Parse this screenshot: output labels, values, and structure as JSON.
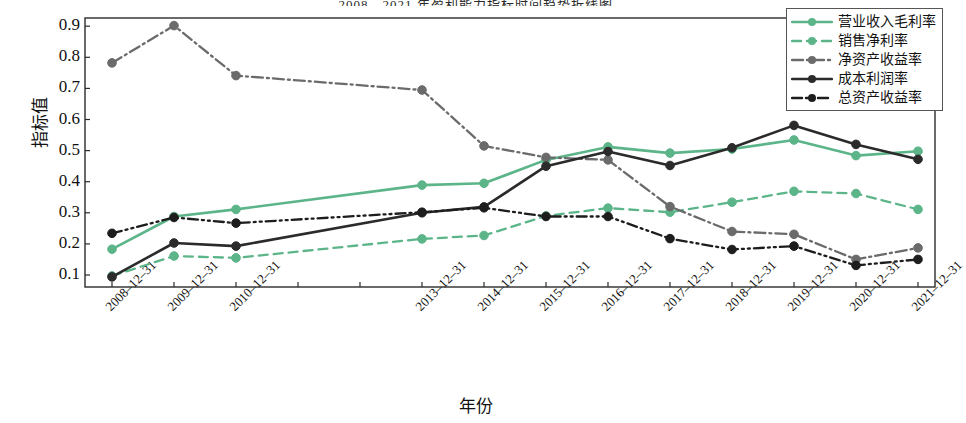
{
  "chart_data": {
    "type": "line",
    "title": "2008—2021 年盈利能力指标时间趋势折线图",
    "xlabel": "年份",
    "ylabel": "指标值",
    "ylim": [
      0.06,
      0.95
    ],
    "yticks": [
      0.1,
      0.2,
      0.3,
      0.4,
      0.5,
      0.6,
      0.7,
      0.8,
      0.9
    ],
    "ytick_labels": [
      "0.1",
      "0.2",
      "0.3",
      "0.4",
      "0.5",
      "0.6",
      "0.7",
      "0.8",
      "0.9"
    ],
    "grid": false,
    "legend_position": "top-right",
    "categories": [
      "2008-12-31",
      "2009-12-31",
      "2010-12-31",
      "2011-12-31",
      "2012-12-31",
      "2013-12-31",
      "2014-12-31",
      "2015-12-31",
      "2016-12-31",
      "2017-12-31",
      "2018-12-31",
      "2019-12-31",
      "2020-12-31",
      "2021-12-31"
    ],
    "tick_labels": [
      "2008–12–31",
      "2009–12–31",
      "2010–12–31",
      "",
      "",
      "2013–12–31",
      "2014–12–31",
      "2015–12–31",
      "2016–12–31",
      "2017–12–31",
      "2018–12–31",
      "2019–12–31",
      "2020–12–31",
      "2021–12–31"
    ],
    "series": [
      {
        "name": "营业收入毛利率",
        "color": "#5cb589",
        "style": "solid",
        "values": [
          0.183,
          0.288,
          0.311,
          null,
          null,
          0.389,
          0.395,
          0.47,
          0.512,
          0.492,
          0.505,
          0.534,
          0.484,
          0.498
        ]
      },
      {
        "name": "销售净利率",
        "color": "#5cb589",
        "style": "dashed",
        "values": [
          0.097,
          0.161,
          0.155,
          null,
          null,
          0.216,
          0.227,
          0.29,
          0.315,
          0.302,
          0.334,
          0.369,
          0.362,
          0.311
        ]
      },
      {
        "name": "净资产收益率",
        "color": "#6b6b6b",
        "style": "dashdot",
        "values": [
          0.782,
          0.902,
          0.741,
          null,
          null,
          0.695,
          0.515,
          0.478,
          0.47,
          0.32,
          0.24,
          0.231,
          0.15,
          0.187
        ]
      },
      {
        "name": "成本利润率",
        "color": "#2b2b2b",
        "style": "solid",
        "values": [
          0.094,
          0.203,
          0.193,
          null,
          null,
          0.3,
          0.319,
          0.45,
          0.497,
          0.452,
          0.509,
          0.581,
          0.52,
          0.472
        ]
      },
      {
        "name": "总资产收益率",
        "color": "#1d1d1d",
        "style": "dashdotdot",
        "values": [
          0.234,
          0.285,
          0.267,
          null,
          null,
          0.302,
          0.316,
          0.288,
          0.288,
          0.217,
          0.182,
          0.193,
          0.131,
          0.15
        ]
      }
    ]
  },
  "legend": {
    "items": [
      {
        "label": "营业收入毛利率"
      },
      {
        "label": "销售净利率"
      },
      {
        "label": "净资产收益率"
      },
      {
        "label": "成本利润率"
      },
      {
        "label": "总资产收益率"
      }
    ]
  },
  "axes": {
    "y_title": "指标值",
    "x_title": "年份"
  }
}
